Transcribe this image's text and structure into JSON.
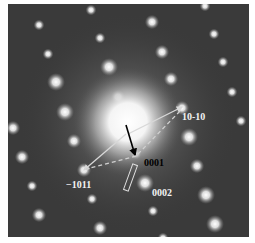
{
  "figure": {
    "type": "electron diffraction pattern",
    "background_color": "#3a3a3a",
    "central_beam": {
      "x": 120,
      "y": 118,
      "radius": 34
    },
    "spots": [
      {
        "x": 83,
        "y": 6,
        "r": 3
      },
      {
        "x": 197,
        "y": 2,
        "r": 3
      },
      {
        "x": 31,
        "y": 21,
        "r": 3
      },
      {
        "x": 144,
        "y": 18,
        "r": 4
      },
      {
        "x": 92,
        "y": 34,
        "r": 3
      },
      {
        "x": 206,
        "y": 30,
        "r": 3
      },
      {
        "x": 40,
        "y": 50,
        "r": 3
      },
      {
        "x": 154,
        "y": 48,
        "r": 4
      },
      {
        "x": 101,
        "y": 63,
        "r": 5
      },
      {
        "x": 215,
        "y": 58,
        "r": 3
      },
      {
        "x": 48,
        "y": 78,
        "r": 5
      },
      {
        "x": 163,
        "y": 75,
        "r": 4
      },
      {
        "x": 224,
        "y": 88,
        "r": 3
      },
      {
        "x": 110,
        "y": 93,
        "r": 4
      },
      {
        "x": 57,
        "y": 108,
        "r": 5
      },
      {
        "x": 174,
        "y": 104,
        "r": 4
      },
      {
        "x": 5,
        "y": 124,
        "r": 4
      },
      {
        "x": 233,
        "y": 117,
        "r": 3
      },
      {
        "x": 66,
        "y": 137,
        "r": 4
      },
      {
        "x": 181,
        "y": 133,
        "r": 5
      },
      {
        "x": 14,
        "y": 153,
        "r": 4
      },
      {
        "x": 128,
        "y": 150,
        "r": 3
      },
      {
        "x": 76,
        "y": 166,
        "r": 4
      },
      {
        "x": 189,
        "y": 162,
        "r": 4
      },
      {
        "x": 137,
        "y": 179,
        "r": 5
      },
      {
        "x": 24,
        "y": 182,
        "r": 3
      },
      {
        "x": 198,
        "y": 191,
        "r": 5
      },
      {
        "x": 84,
        "y": 195,
        "r": 3
      },
      {
        "x": 145,
        "y": 207,
        "r": 3
      },
      {
        "x": 31,
        "y": 211,
        "r": 4
      },
      {
        "x": 207,
        "y": 220,
        "r": 5
      },
      {
        "x": 92,
        "y": 224,
        "r": 4
      },
      {
        "x": 155,
        "y": 234,
        "r": 3
      }
    ],
    "arrows": [
      {
        "name": "arrow-10-10",
        "color": "#d8d8d8",
        "dashed": false,
        "x1": 120,
        "y1": 130,
        "x2": 174,
        "y2": 103
      },
      {
        "name": "arrow-minus1011",
        "color": "#d8d8d8",
        "dashed": false,
        "x1": 118,
        "y1": 130,
        "x2": 76,
        "y2": 166
      },
      {
        "name": "arrow-0001",
        "color": "#000000",
        "dashed": false,
        "x1": 118,
        "y1": 121,
        "x2": 127,
        "y2": 151
      },
      {
        "name": "dashed-line-a",
        "color": "#d0d0d0",
        "dashed": true,
        "x1": 128,
        "y1": 152,
        "x2": 78,
        "y2": 165
      },
      {
        "name": "dashed-line-b",
        "color": "#d0d0d0",
        "dashed": true,
        "x1": 130,
        "y1": 150,
        "x2": 174,
        "y2": 105
      }
    ],
    "slit_rect": {
      "x": 120,
      "y": 160,
      "width": 5,
      "height": 27,
      "rotate": 20,
      "stroke": "#e0e0e0"
    },
    "labels": [
      {
        "name": "label-10-10",
        "text": "10-10",
        "x": 174,
        "y": 108,
        "color": "#f2f2f2"
      },
      {
        "name": "label-0001",
        "text": "0001",
        "x": 136,
        "y": 154,
        "color": "#000000"
      },
      {
        "name": "label-minus1011",
        "text": "−1011",
        "x": 58,
        "y": 176,
        "color": "#f2f2f2"
      },
      {
        "name": "label-0002",
        "text": "0002",
        "x": 144,
        "y": 184,
        "color": "#f2f2f2"
      }
    ]
  }
}
